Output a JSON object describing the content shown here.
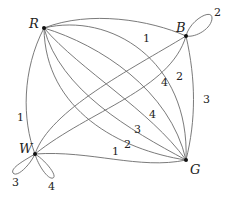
{
  "diagram": {
    "type": "multigraph",
    "vertices": [
      {
        "id": "R",
        "label": "R",
        "x": 44,
        "y": 28
      },
      {
        "id": "B",
        "label": "B",
        "x": 186,
        "y": 36
      },
      {
        "id": "W",
        "label": "W",
        "x": 35,
        "y": 154
      },
      {
        "id": "G",
        "label": "G",
        "x": 186,
        "y": 160
      }
    ],
    "edges": [
      {
        "from": "R",
        "to": "B",
        "label": "1"
      },
      {
        "from": "R",
        "to": "W",
        "label": "1"
      },
      {
        "from": "B",
        "to": "W",
        "label": "2"
      },
      {
        "from": "B",
        "to": "G",
        "label": "3"
      },
      {
        "from": "W",
        "to": "G",
        "label": "1"
      },
      {
        "from": "R",
        "to": "G",
        "label": "2"
      },
      {
        "from": "R",
        "to": "G",
        "label": "3"
      },
      {
        "from": "R",
        "to": "G",
        "label": "4"
      },
      {
        "from": "R",
        "to": "G",
        "label": "4"
      },
      {
        "from": "B",
        "to": "B",
        "label": "2"
      },
      {
        "from": "W",
        "to": "W",
        "label": "3"
      },
      {
        "from": "W",
        "to": "W",
        "label": "4"
      }
    ]
  }
}
